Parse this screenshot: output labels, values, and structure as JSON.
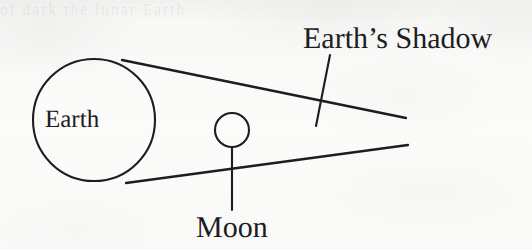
{
  "figure": {
    "caption_present": false,
    "background_color": "#f8f8f7",
    "ink_color": "#1d1d1f",
    "ghost_text_top": "of    dark        the             lunar       Earth",
    "labels": {
      "earth": "Earth",
      "moon": "Moon",
      "earths_shadow": "Earth’s Shadow"
    },
    "shapes": {
      "earth_circle": {
        "name": "earth-circle",
        "cx": 94,
        "cy": 120,
        "r": 61
      },
      "moon_circle": {
        "name": "moon-circle",
        "cx": 232,
        "cy": 130,
        "r": 17
      },
      "shadow_cone_upper": {
        "name": "shadow-cone-upper-line",
        "x1": 122,
        "y1": 60,
        "x2": 406,
        "y2": 118
      },
      "shadow_cone_lower": {
        "name": "shadow-cone-lower-line",
        "x1": 126,
        "y1": 183,
        "x2": 408,
        "y2": 145
      },
      "shadow_leader": {
        "name": "shadow-leader-line",
        "x1": 330,
        "y1": 55,
        "x2": 316,
        "y2": 126
      },
      "moon_leader": {
        "name": "moon-leader-line",
        "x1": 232,
        "y1": 147,
        "x2": 232,
        "y2": 210
      }
    }
  }
}
